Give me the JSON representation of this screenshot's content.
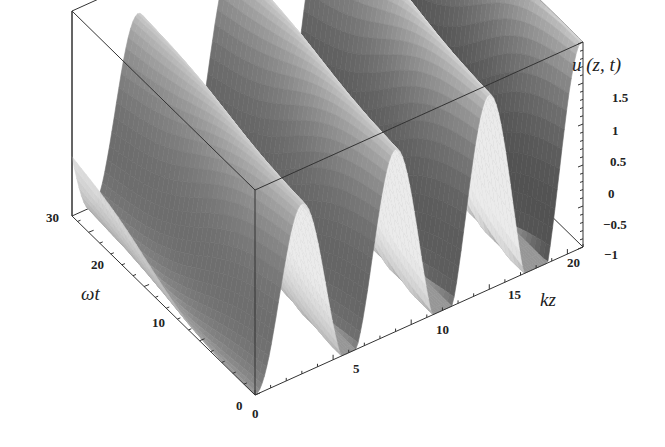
{
  "chart_data": {
    "type": "surface3d",
    "title": "",
    "function_label": "u (z, t)",
    "x_axis": {
      "label": "kz",
      "range": [
        0,
        21
      ],
      "ticks": [
        0,
        5,
        10,
        15,
        20
      ]
    },
    "y_axis": {
      "label": "ωt",
      "range": [
        0,
        33
      ],
      "ticks": [
        0,
        10,
        20,
        30
      ]
    },
    "z_axis": {
      "label": "u (z, t)",
      "range": [
        -1,
        1.5
      ],
      "ticks": [
        -1,
        -0.5,
        0,
        0.5,
        1,
        1.5
      ]
    },
    "approx_trough_positions_kz": [
      1,
      5.5,
      11.5,
      19
    ],
    "approx_peak_values": [
      1.0,
      1.1,
      1.2,
      1.3,
      1.4,
      1.5
    ],
    "box": true,
    "grid": false,
    "colormap": "grayscale"
  },
  "labels": {
    "u_title": "u (z, t)",
    "kz_title": "kz",
    "wt_title": "ωt",
    "u_ticks": [
      "1.5",
      "1",
      "0.5",
      "0",
      "−0.5",
      "−1"
    ],
    "kz_ticks": [
      "0",
      "5",
      "10",
      "15",
      "20"
    ],
    "wt_ticks": [
      "0",
      "10",
      "20",
      "30"
    ]
  }
}
